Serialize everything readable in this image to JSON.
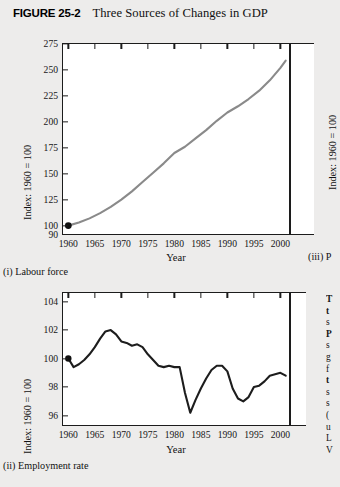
{
  "figure": {
    "number": "FIGURE 25-2",
    "title": "Three Sources of Changes in GDP"
  },
  "chart_data": [
    {
      "type": "line",
      "panel": "(i) Labour force",
      "title": "",
      "xlabel": "Year",
      "ylabel": "Index: 1960 = 100",
      "xlim": [
        1959,
        2002
      ],
      "ylim": [
        90,
        275
      ],
      "yticks": [
        275,
        250,
        225,
        200,
        175,
        150,
        125,
        100
      ],
      "axis_break_label": "90",
      "xticks": [
        1960,
        1965,
        1970,
        1975,
        1980,
        1985,
        1990,
        1995,
        2000
      ],
      "grid": false,
      "legend": "none",
      "line_color": "#8a8a8a",
      "marker": {
        "x": 1960,
        "y": 100,
        "color": "#111111"
      },
      "x": [
        1960,
        1962,
        1964,
        1966,
        1968,
        1970,
        1972,
        1974,
        1976,
        1978,
        1980,
        1982,
        1984,
        1986,
        1988,
        1990,
        1992,
        1994,
        1996,
        1998,
        2000,
        2001
      ],
      "values": [
        100,
        103,
        107,
        112,
        118,
        125,
        133,
        142,
        151,
        160,
        170,
        176,
        184,
        192,
        201,
        209,
        215,
        222,
        230,
        240,
        252,
        259
      ]
    },
    {
      "type": "line",
      "panel": "(ii) Employment rate",
      "title": "",
      "xlabel": "Year",
      "ylabel": "Index: 1960 = 100",
      "xlim": [
        1959,
        2002
      ],
      "ylim": [
        95.2,
        104.6
      ],
      "yticks": [
        104,
        102,
        100,
        98,
        96
      ],
      "xticks": [
        1960,
        1965,
        1970,
        1975,
        1980,
        1985,
        1990,
        1995,
        2000
      ],
      "grid": false,
      "legend": "none",
      "line_color": "#1d1d1d",
      "marker": {
        "x": 1960,
        "y": 100,
        "color": "#111111"
      },
      "x": [
        1960,
        1961,
        1962,
        1963,
        1964,
        1965,
        1966,
        1967,
        1968,
        1969,
        1970,
        1971,
        1972,
        1973,
        1974,
        1975,
        1976,
        1977,
        1978,
        1979,
        1980,
        1981,
        1982,
        1983,
        1984,
        1985,
        1986,
        1987,
        1988,
        1989,
        1990,
        1991,
        1992,
        1993,
        1994,
        1995,
        1996,
        1997,
        1998,
        1999,
        2000,
        2001
      ],
      "values": [
        100.0,
        99.4,
        99.6,
        99.9,
        100.3,
        100.8,
        101.4,
        101.9,
        102.0,
        101.7,
        101.2,
        101.1,
        100.9,
        101.0,
        100.8,
        100.3,
        99.9,
        99.5,
        99.4,
        99.5,
        99.4,
        99.4,
        97.6,
        96.2,
        97.1,
        97.9,
        98.6,
        99.2,
        99.5,
        99.5,
        99.1,
        97.9,
        97.2,
        97.0,
        97.3,
        98.0,
        98.1,
        98.4,
        98.8,
        98.9,
        99.0,
        98.8
      ]
    },
    {
      "type": "line",
      "panel": "(iii) P",
      "ylabel": "Index: 1960 = 100",
      "cropped": true,
      "note": "panel partially cut off at right edge of image"
    }
  ],
  "side_text": {
    "cropped": true,
    "lines": [
      "T",
      "t",
      "s",
      "P",
      "s",
      "g",
      "f",
      "t",
      "s",
      "s",
      "",
      "(",
      "u",
      "L",
      "V"
    ]
  }
}
